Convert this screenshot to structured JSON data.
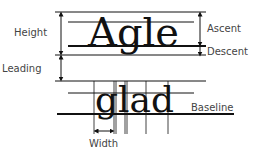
{
  "diagram": {
    "sample_words": {
      "upper": "Agle",
      "lower": "glad"
    },
    "labels": {
      "height": "Height",
      "ascent": "Ascent",
      "descent": "Descent",
      "leading": "Leading",
      "baseline": "Baseline",
      "width": "Width"
    },
    "colors": {
      "line": "#111111",
      "text": "#444444"
    }
  }
}
